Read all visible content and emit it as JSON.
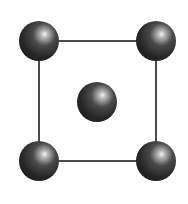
{
  "diagram": {
    "type": "crystal-lattice-unit-cell",
    "colors": {
      "background": "#ffffff",
      "bond_line": "#4a4a4a",
      "atom_dark": "#1c1c1c",
      "atom_mid": "#4a4a4a",
      "atom_highlight": "#f4f4f4"
    },
    "frame": {
      "x1": 39,
      "y1": 41,
      "x2": 156,
      "y2": 161,
      "stroke_width": 2
    },
    "atom_radius": 20,
    "atoms": [
      {
        "id": "top-left",
        "cx": 39,
        "cy": 41
      },
      {
        "id": "top-right",
        "cx": 156,
        "cy": 41
      },
      {
        "id": "center",
        "cx": 97,
        "cy": 102
      },
      {
        "id": "bottom-left",
        "cx": 39,
        "cy": 161
      },
      {
        "id": "bottom-right",
        "cx": 156,
        "cy": 161
      }
    ]
  }
}
